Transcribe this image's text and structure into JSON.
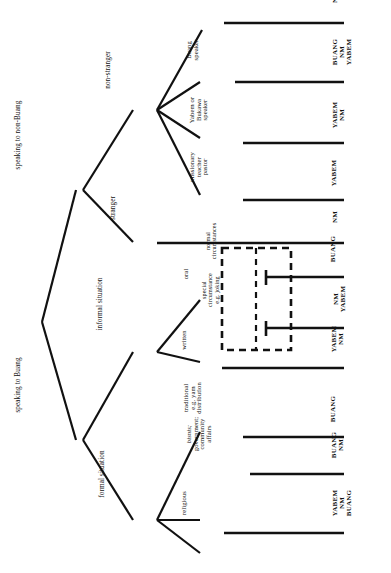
{
  "diagram": {
    "title": "decision to speak",
    "type": "decision-tree",
    "orientation": "rotated-90",
    "root": {
      "label": "decision to speak"
    },
    "level2": [
      {
        "id": "non-buang",
        "label": "speaking to non-Buang"
      },
      {
        "id": "buang",
        "label": "speaking to Buang"
      }
    ],
    "level3": [
      {
        "id": "non-stranger",
        "label": "non-stranger",
        "parent": "non-buang"
      },
      {
        "id": "stranger",
        "label": "stranger",
        "parent": "non-buang"
      },
      {
        "id": "informal",
        "label": "informal situation",
        "parent": "buang"
      },
      {
        "id": "formal",
        "label": "formal situation",
        "parent": "buang"
      }
    ],
    "leaves": [
      {
        "id": "other",
        "label": "other",
        "lines": [
          "other"
        ],
        "parent": "non-stranger",
        "outcome": [
          "NM"
        ]
      },
      {
        "id": "buang-speaker",
        "label": "Buang speaker",
        "lines": [
          "Buang",
          "speaker"
        ],
        "parent": "non-stranger",
        "outcome": [
          "BUANG",
          "NM",
          "YABEM"
        ]
      },
      {
        "id": "yabem-bukawa-speaker",
        "label": "Yabem or Bukawa speaker",
        "lines": [
          "Yabem or",
          "Bukawa",
          "speaker"
        ],
        "parent": "non-stranger",
        "outcome": [
          "YABEM",
          "NM"
        ]
      },
      {
        "id": "missionary",
        "label": "missionary teacher pastor",
        "lines": [
          "missionary",
          "teacher",
          "pastor"
        ],
        "parent": "non-stranger",
        "outcome": [
          "YABEM"
        ]
      },
      {
        "id": "stranger-leaf",
        "label": "stranger",
        "lines": [
          "stranger"
        ],
        "parent": "non-buang",
        "outcome": [
          "NM"
        ]
      },
      {
        "id": "oral",
        "label": "oral",
        "lines": [
          "oral"
        ],
        "parent": "informal",
        "outcome": [
          "BUANG"
        ]
      },
      {
        "id": "oral-special",
        "label": "oral special circumstances",
        "lines": [],
        "parent": "informal",
        "outcome": [
          "NM",
          "YABEM"
        ]
      },
      {
        "id": "written",
        "label": "written",
        "lines": [
          "written"
        ],
        "parent": "informal",
        "outcome": [
          "YABEM",
          "NM"
        ]
      },
      {
        "id": "traditional",
        "label": "traditional e.g. yam distribution",
        "lines": [
          "traditional",
          "e.g. yam",
          "distribution"
        ],
        "parent": "formal",
        "outcome": [
          "BUANG"
        ]
      },
      {
        "id": "bisnis",
        "label": "bisnis; government; community affairs",
        "lines": [
          "bisnis;",
          "government;",
          "community",
          "affairs"
        ],
        "parent": "formal",
        "outcome": [
          "BUANG",
          "NM"
        ]
      },
      {
        "id": "religious",
        "label": "religious",
        "lines": [
          "religious"
        ],
        "parent": "formal",
        "outcome": [
          "YABEM",
          "NM",
          "BUANG"
        ]
      }
    ],
    "dashed_box": {
      "label": "circumstance box",
      "entries": [
        {
          "id": "normal",
          "lines": [
            "normal",
            "circumstances"
          ]
        },
        {
          "id": "special",
          "lines": [
            "special",
            "circumstance",
            "e.g. joking"
          ]
        }
      ]
    },
    "colors": {
      "line": "#111111",
      "text": "#111111",
      "background": "#ffffff"
    }
  }
}
